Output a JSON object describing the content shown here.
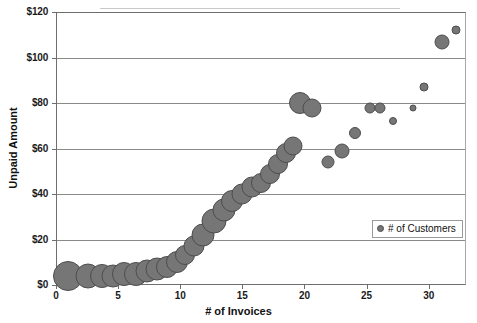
{
  "chart_data": {
    "type": "scatter",
    "title": "",
    "xlabel": "# of Invoices",
    "ylabel": "Unpaid Amount",
    "xlim": [
      0,
      33
    ],
    "ylim": [
      0,
      120
    ],
    "xticks": [
      0,
      5,
      10,
      15,
      20,
      25,
      30
    ],
    "xtick_labels": [
      "0",
      "5",
      "10",
      "15",
      "20",
      "25",
      "30"
    ],
    "yticks": [
      0,
      20,
      40,
      60,
      80,
      100,
      120
    ],
    "ytick_labels": [
      "$0",
      "$20",
      "$40",
      "$60",
      "$80",
      "$100",
      "$120"
    ],
    "grid": "horizontal",
    "legend_position": "inside-right",
    "series": [
      {
        "name": "# of Customers",
        "marker_color": "#767676",
        "marker_edge_color": "#4d4d4d",
        "points": [
          {
            "x": 1.0,
            "y": 4,
            "size": 30
          },
          {
            "x": 2.6,
            "y": 4,
            "size": 25
          },
          {
            "x": 3.7,
            "y": 4,
            "size": 24
          },
          {
            "x": 4.6,
            "y": 4,
            "size": 23
          },
          {
            "x": 5.5,
            "y": 5,
            "size": 24
          },
          {
            "x": 6.4,
            "y": 5,
            "size": 24
          },
          {
            "x": 7.3,
            "y": 6,
            "size": 23
          },
          {
            "x": 8.1,
            "y": 7,
            "size": 23
          },
          {
            "x": 8.9,
            "y": 8,
            "size": 22
          },
          {
            "x": 9.7,
            "y": 10,
            "size": 22
          },
          {
            "x": 10.4,
            "y": 13,
            "size": 20
          },
          {
            "x": 11.1,
            "y": 17,
            "size": 21
          },
          {
            "x": 11.8,
            "y": 22,
            "size": 23
          },
          {
            "x": 12.7,
            "y": 28,
            "size": 25
          },
          {
            "x": 13.5,
            "y": 33,
            "size": 23
          },
          {
            "x": 14.2,
            "y": 37,
            "size": 22
          },
          {
            "x": 15.0,
            "y": 40,
            "size": 21
          },
          {
            "x": 15.8,
            "y": 43,
            "size": 21
          },
          {
            "x": 16.5,
            "y": 45,
            "size": 20
          },
          {
            "x": 17.2,
            "y": 49,
            "size": 20
          },
          {
            "x": 17.9,
            "y": 53,
            "size": 20
          },
          {
            "x": 18.5,
            "y": 58,
            "size": 20
          },
          {
            "x": 19.1,
            "y": 61,
            "size": 19
          },
          {
            "x": 19.6,
            "y": 80,
            "size": 22
          },
          {
            "x": 20.6,
            "y": 78,
            "size": 19
          },
          {
            "x": 21.9,
            "y": 54,
            "size": 13
          },
          {
            "x": 23.0,
            "y": 59,
            "size": 15
          },
          {
            "x": 24.1,
            "y": 67,
            "size": 12
          },
          {
            "x": 25.3,
            "y": 78,
            "size": 11
          },
          {
            "x": 26.1,
            "y": 78,
            "size": 11
          },
          {
            "x": 27.1,
            "y": 72,
            "size": 8
          },
          {
            "x": 28.7,
            "y": 78,
            "size": 7
          },
          {
            "x": 29.6,
            "y": 87,
            "size": 9
          },
          {
            "x": 31.1,
            "y": 107,
            "size": 15
          },
          {
            "x": 32.2,
            "y": 112,
            "size": 9
          }
        ]
      }
    ]
  },
  "legend": {
    "label": "# of Customers"
  }
}
